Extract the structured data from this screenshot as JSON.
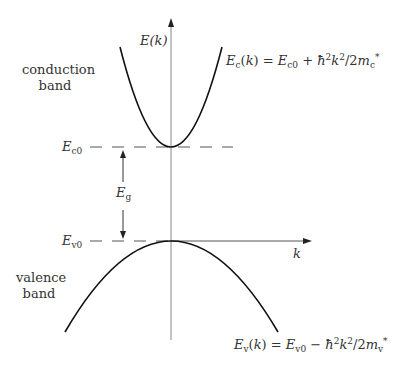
{
  "diagram": {
    "axes": {
      "y_label": "E(k)",
      "x_label": "k"
    },
    "bands": {
      "conduction": {
        "label_line1": "conduction",
        "label_line2": "band",
        "minimum_label": "Ec0",
        "equation": "Ec(k) = Ec0 + ħ²k²/2mc*"
      },
      "valence": {
        "label_line1": "valence",
        "label_line2": "band",
        "maximum_label": "Ev0",
        "equation": "Ev(k) = Ev0 − ħ²k²/2mv*"
      }
    },
    "gap": {
      "label": "Eg"
    },
    "colors": {
      "curve": "#111111",
      "axis": "#888888",
      "text": "#333333"
    }
  }
}
